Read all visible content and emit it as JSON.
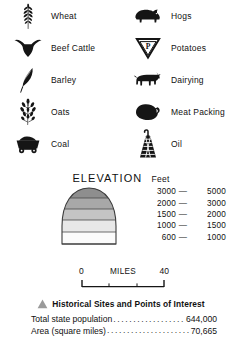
{
  "symbol_legend": {
    "left_column": [
      {
        "label": "Wheat",
        "icon": "wheat-stalk-icon"
      },
      {
        "label": "Beef  Cattle",
        "icon": "steer-head-icon"
      },
      {
        "label": "Barley",
        "icon": "barley-head-icon"
      },
      {
        "label": "Oats",
        "icon": "oat-panicle-icon"
      },
      {
        "label": "Coal",
        "icon": "coal-cart-icon"
      }
    ],
    "right_column": [
      {
        "label": "Hogs",
        "icon": "hog-icon"
      },
      {
        "label": "Potatoes",
        "icon": "potato-triangle-icon"
      },
      {
        "label": "Dairying",
        "icon": "dairy-cow-icon"
      },
      {
        "label": "Meat Packing",
        "icon": "ham-icon"
      },
      {
        "label": "Oil",
        "icon": "oil-derrick-icon"
      }
    ]
  },
  "elevation": {
    "title": "ELEVATION",
    "unit": "Feet",
    "bands": [
      {
        "low": "3000",
        "dash": "—",
        "high": "5000",
        "color": "#8e8e8e"
      },
      {
        "low": "2000",
        "dash": "—",
        "high": "3000",
        "color": "#a8a8a8"
      },
      {
        "low": "1500",
        "dash": "—",
        "high": "2000",
        "color": "#c4c4c4"
      },
      {
        "low": "1000",
        "dash": "—",
        "high": "1500",
        "color": "#e0e0e0"
      },
      {
        "low": "600",
        "dash": "—",
        "high": "1000",
        "color": "#f4f4f4"
      }
    ]
  },
  "scale": {
    "start": "0",
    "end": "40",
    "units": "MILES"
  },
  "historical": {
    "label": "Historical Sites and Points of Interest",
    "marker_color": "#9a9a9a"
  },
  "statistics": [
    {
      "label": "Total state population",
      "dots": "........................................",
      "value": "644,000"
    },
    {
      "label": "Area (square miles)",
      "dots": "........................................",
      "value": "70,665"
    }
  ]
}
